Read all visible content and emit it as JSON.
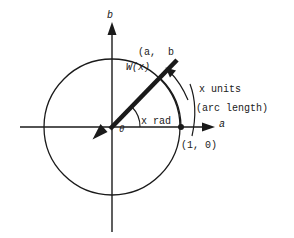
{
  "figure": {
    "background_color": "#ffffff",
    "stroke_color": "#1a1a1a",
    "labels": {
      "axis_b": "b",
      "axis_a": "a",
      "point_ab": "(a,  b",
      "wrapping_function": "W(x)",
      "x_units": "x units",
      "arc_length": "(arc length)",
      "x_rad": "x rad",
      "theta": "θ",
      "point_10": "(1, 0)"
    },
    "geometry": {
      "origin_x": 112,
      "origin_y": 127,
      "circle_radius": 68,
      "terminal_point_x": 170,
      "terminal_point_y": 68,
      "unit_point_x": 181,
      "unit_point_y": 127,
      "angle_arc_radius": 28,
      "ray_end_x": 177,
      "ray_end_y": 60
    }
  }
}
